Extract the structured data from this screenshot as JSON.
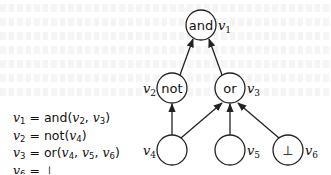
{
  "diagram": {
    "type": "expression-dag",
    "nodes": [
      {
        "id": "v1",
        "var": "v",
        "sub": "1",
        "label": "and",
        "cx": 201,
        "cy": 25
      },
      {
        "id": "v2",
        "var": "v",
        "sub": "2",
        "label": "not",
        "cx": 172,
        "cy": 88
      },
      {
        "id": "v3",
        "var": "v",
        "sub": "3",
        "label": "or",
        "cx": 230,
        "cy": 88
      },
      {
        "id": "v4",
        "var": "v",
        "sub": "4",
        "label": "",
        "cx": 172,
        "cy": 150
      },
      {
        "id": "v5",
        "var": "v",
        "sub": "5",
        "label": "",
        "cx": 230,
        "cy": 150
      },
      {
        "id": "v6",
        "var": "v",
        "sub": "6",
        "label": "⊥",
        "cx": 288,
        "cy": 150
      }
    ],
    "edges": [
      {
        "from": "v2",
        "to": "v1"
      },
      {
        "from": "v3",
        "to": "v1"
      },
      {
        "from": "v4",
        "to": "v2"
      },
      {
        "from": "v4",
        "to": "v3"
      },
      {
        "from": "v5",
        "to": "v3"
      },
      {
        "from": "v6",
        "to": "v3"
      }
    ],
    "equations": [
      {
        "lhs": "v",
        "lhs_sub": "1",
        "eq": "=",
        "fn": "and",
        "args": [
          [
            "v",
            "2"
          ],
          [
            "v",
            "3"
          ]
        ]
      },
      {
        "lhs": "v",
        "lhs_sub": "2",
        "eq": "=",
        "fn": "not",
        "args": [
          [
            "v",
            "4"
          ]
        ]
      },
      {
        "lhs": "v",
        "lhs_sub": "3",
        "eq": "=",
        "fn": "or",
        "args": [
          [
            "v",
            "4"
          ],
          [
            "v",
            "5"
          ],
          [
            "v",
            "6"
          ]
        ]
      },
      {
        "lhs": "v",
        "lhs_sub": "6",
        "eq": "=",
        "value": "⊥"
      }
    ],
    "text": {
      "n1_label": "and",
      "n2_label": "not",
      "n3_label": "or",
      "n6_label": "⊥",
      "v": "v",
      "s1": "1",
      "s2": "2",
      "s3": "3",
      "s4": "4",
      "s5": "5",
      "s6": "6",
      "eq": " = ",
      "lp": "(",
      "rp": ")",
      "comma": ", ",
      "fn_and": "and",
      "fn_not": "not",
      "fn_or": "or",
      "bottom": "⊥"
    }
  }
}
